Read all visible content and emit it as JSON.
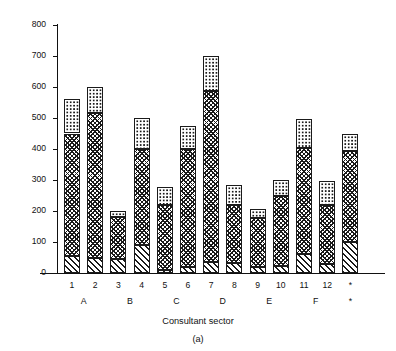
{
  "chart_data": {
    "type": "bar",
    "subtype": "stacked-bar",
    "title": "",
    "caption": "(a)",
    "xlabel": "Consultant sector",
    "ylabel": "Number of contacts or DNAs",
    "ylim": [
      0,
      800
    ],
    "ytick_labels": [
      "0",
      "100",
      "200",
      "300",
      "400",
      "500",
      "600",
      "700",
      "800"
    ],
    "yticks": [
      0,
      100,
      200,
      300,
      400,
      500,
      600,
      700,
      800
    ],
    "grid": false,
    "legend": "none",
    "categories": [
      "1",
      "2",
      "3",
      "4",
      "5",
      "6",
      "7",
      "8",
      "9",
      "10",
      "11",
      "12",
      "*"
    ],
    "group_labels": [
      "A",
      "B",
      "C",
      "D",
      "E",
      "F",
      "*"
    ],
    "group_spans": [
      [
        0,
        1
      ],
      [
        2,
        3
      ],
      [
        4,
        5
      ],
      [
        6,
        7
      ],
      [
        8,
        9
      ],
      [
        10,
        11
      ],
      [
        12,
        12
      ]
    ],
    "series": [
      {
        "name": "bottom-segment",
        "pattern": "diagonal-hatch",
        "values": [
          55,
          50,
          45,
          90,
          10,
          20,
          35,
          32,
          18,
          22,
          60,
          30,
          100
        ]
      },
      {
        "name": "middle-segment",
        "pattern": "cross-hatch",
        "values": [
          395,
          465,
          135,
          310,
          210,
          380,
          552,
          188,
          160,
          228,
          343,
          188,
          295
        ]
      },
      {
        "name": "top-segment",
        "pattern": "dotted",
        "values": [
          110,
          85,
          20,
          100,
          58,
          75,
          113,
          65,
          27,
          50,
          94,
          79,
          55
        ]
      }
    ],
    "cumulative_tops": {
      "bottom": [
        55,
        50,
        45,
        90,
        10,
        20,
        35,
        32,
        18,
        22,
        60,
        30,
        100
      ],
      "middle": [
        450,
        515,
        180,
        400,
        220,
        400,
        587,
        220,
        178,
        250,
        403,
        218,
        395
      ],
      "total": [
        560,
        600,
        200,
        500,
        278,
        475,
        700,
        285,
        205,
        300,
        497,
        297,
        450
      ]
    },
    "colors": {
      "ink": "#1a1a1a",
      "background": "#ffffff"
    }
  }
}
